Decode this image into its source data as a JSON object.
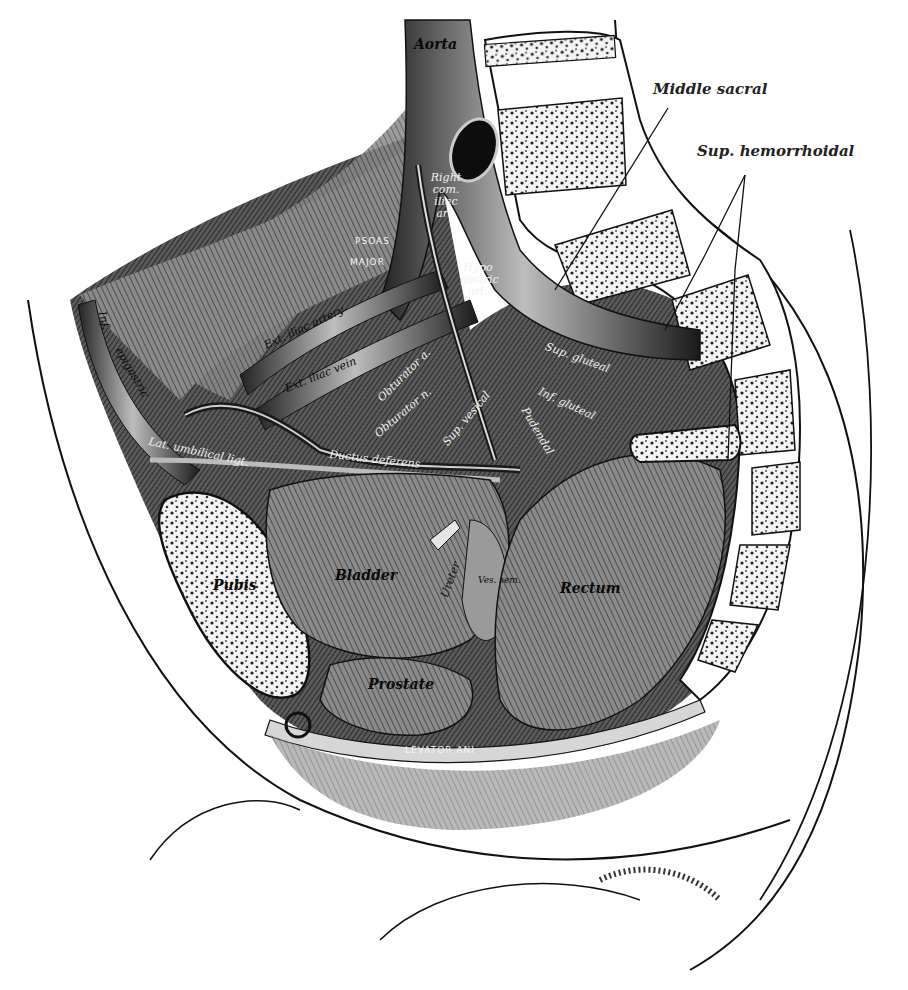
{
  "figure": {
    "colors": {
      "ink": "#111111",
      "background": "#ffffff",
      "shade_dark": "#2b2b2b",
      "shade_mid": "#6e6e6e",
      "bone_fill": "#f4f4f4"
    }
  },
  "external_labels": {
    "middle_sacral": "Middle sacral",
    "sup_hemorrhoidal": "Sup. hemorrhoidal"
  },
  "internal_labels": {
    "aorta": "Aorta",
    "right_common_iliac": "Right com. iliac art.",
    "hypogastric": "Hypo gastric art.",
    "psoas": "PSOAS",
    "psoas_major": "MAJOR",
    "ext_iliac_artery": "Ext. iliac artery",
    "ext_iliac_vein": "Ext. iliac vein",
    "inf_epigastric_1": "Inf.",
    "inf_epigastric_2": "epigastric",
    "lat_umbilical_ligt": "Lat. umbilical ligt.",
    "ductus_deferens": "Ductus deferens",
    "obturator_a": "Obturator a.",
    "obturator_n": "Obturator n.",
    "sup_vesical": "Sup. vesical",
    "sup_gluteal": "Sup. gluteal",
    "inf_gluteal": "Inf. gluteal",
    "pudendal": "Pudendal",
    "ureter": "Ureter",
    "ves_sem": "Ves. sem.",
    "bladder": "Bladder",
    "pubis": "Pubis",
    "rectum": "Rectum",
    "prostate": "Prostate",
    "levator_ani": "LEVATOR ANI"
  }
}
